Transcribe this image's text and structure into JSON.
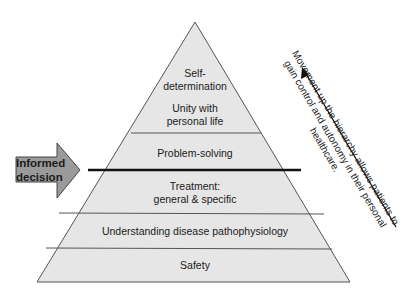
{
  "pyramid": {
    "levels": [
      {
        "label_line1": "Self-",
        "label_line2": "determination"
      },
      {
        "label_line1": "Unity with",
        "label_line2": "personal life"
      },
      {
        "label": "Problem-solving"
      },
      {
        "label_line1": "Treatment:",
        "label_line2": "general & specific"
      },
      {
        "label": "Understanding disease pathophysiology"
      },
      {
        "label": "Safety"
      }
    ],
    "fill_color": "#e6e6e6",
    "line_color": "#555555"
  },
  "decision_arrow": {
    "line1": "Informed",
    "line2": "decision",
    "fill_color": "#9a9a9a"
  },
  "side_note": {
    "line1": "Movement up the hierarchy allows patients to",
    "line2": "gain control and autonomy in their personal",
    "line3": "healthcare."
  }
}
